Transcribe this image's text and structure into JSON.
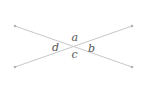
{
  "diagram": {
    "type": "intersecting-lines",
    "line_color": "#c8c8c8",
    "point_color": "#b4b4b4",
    "label_color": "#555555",
    "lines": [
      {
        "from": [
          15,
          26
        ],
        "to": [
          132,
          67
        ]
      },
      {
        "from": [
          15,
          67
        ],
        "to": [
          132,
          26
        ]
      }
    ],
    "intersection": [
      74,
      46.5
    ],
    "angle_labels": {
      "a": "a",
      "b": "b",
      "c": "c",
      "d": "d"
    }
  }
}
